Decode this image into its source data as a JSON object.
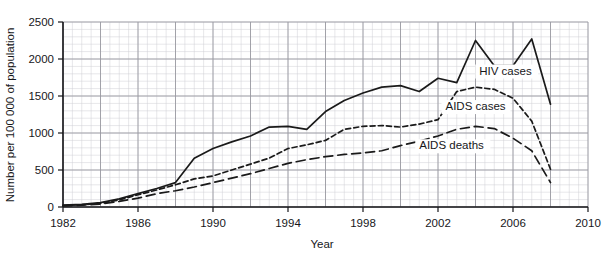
{
  "chart_data": {
    "type": "line",
    "title": "",
    "xlabel": "Year",
    "ylabel": "Number per 100 000 of population",
    "xlim": [
      1982,
      2010
    ],
    "ylim": [
      0,
      2500
    ],
    "xticks": [
      1982,
      1986,
      1990,
      1994,
      1998,
      2002,
      2006,
      2010
    ],
    "yticks": [
      0,
      500,
      1000,
      1500,
      2000,
      2500
    ],
    "xtick_labels": [
      "1982",
      "1986",
      "1990",
      "1994",
      "1998",
      "2002",
      "2006",
      "2010"
    ],
    "ytick_labels": [
      "0",
      "500",
      "1000",
      "1500",
      "2000",
      "2500"
    ],
    "grid": true,
    "grid_major_step_x": 2,
    "grid_major_step_y": 500,
    "grid_minor_step_x": 0.5,
    "grid_minor_step_y": 100,
    "legend": "inline-annotations",
    "x": [
      1982,
      1983,
      1984,
      1985,
      1986,
      1987,
      1988,
      1989,
      1990,
      1991,
      1992,
      1993,
      1994,
      1995,
      1996,
      1997,
      1998,
      1999,
      2000,
      2001,
      2002,
      2003,
      2004,
      2005,
      2006,
      2007,
      2008
    ],
    "series": [
      {
        "name": "HIV cases",
        "style": "solid",
        "color": "#1a1a1a",
        "label_x": 2004.2,
        "label_y": 1790,
        "values": [
          25,
          35,
          60,
          110,
          180,
          250,
          330,
          660,
          790,
          880,
          960,
          1080,
          1090,
          1050,
          1290,
          1440,
          1540,
          1620,
          1640,
          1560,
          1740,
          1680,
          2250,
          1910,
          1910,
          2270,
          1390
        ]
      },
      {
        "name": "AIDS cases",
        "style": "dashed-short",
        "color": "#1a1a1a",
        "label_x": 2002.4,
        "label_y": 1310,
        "values": [
          20,
          30,
          50,
          95,
          165,
          230,
          300,
          380,
          420,
          500,
          580,
          660,
          790,
          840,
          900,
          1050,
          1090,
          1100,
          1080,
          1120,
          1180,
          1560,
          1620,
          1590,
          1470,
          1160,
          510
        ]
      },
      {
        "name": "AIDS deaths",
        "style": "dashed-long",
        "color": "#1a1a1a",
        "label_x": 2001.0,
        "label_y": 780,
        "values": [
          15,
          25,
          40,
          75,
          120,
          180,
          220,
          270,
          330,
          390,
          450,
          520,
          590,
          640,
          680,
          710,
          730,
          760,
          830,
          890,
          960,
          1050,
          1090,
          1060,
          930,
          760,
          330
        ]
      }
    ]
  },
  "axes": {
    "y_title": "Number per 100 000 of population",
    "x_title": "Year"
  }
}
